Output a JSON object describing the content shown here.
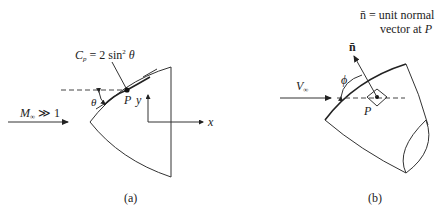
{
  "panel_a": {
    "caption": "(a)",
    "freestream_label_main": "M",
    "freestream_label_sub": "∞",
    "freestream_label_rest": " ≫ 1",
    "pressure_label_main": "C",
    "pressure_label_sub": "p",
    "pressure_label_rest": " = 2 sin",
    "pressure_label_sup": "2",
    "pressure_label_theta": " θ",
    "angle_label": "θ",
    "point_label": "P",
    "y_axis_label": "y",
    "x_axis_label": "x"
  },
  "panel_b": {
    "caption": "(b)",
    "freestream_label_main": "V",
    "freestream_label_sub": "∞",
    "normal_label": "n̄",
    "angle_label": "ϕ",
    "point_label": "P",
    "note_line1": "n̄ = unit normal",
    "note_line2_text": "vector at ",
    "note_line2_point": "P"
  },
  "colors": {
    "ink": "#222222",
    "background": "#ffffff"
  }
}
